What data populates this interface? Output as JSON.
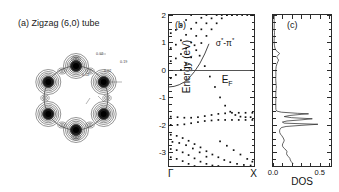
{
  "figure": {
    "panels": [
      "a",
      "b",
      "c"
    ]
  },
  "panel_a": {
    "label": "(a) Zigzag (6,0) tube",
    "type": "contour",
    "description": "charge density contour cross-section of zigzag (6,0) nanotube with 6 carbon atom lobes around a ring",
    "atom_count": 6,
    "contour_labels": [
      {
        "text": "0.02",
        "x": 96,
        "y": 53
      },
      {
        "text": "0.19",
        "x": 118,
        "y": 61
      },
      {
        "text": "0.02",
        "x": 102,
        "y": 70
      },
      {
        "text": "0.02",
        "x": 84,
        "y": 73
      }
    ]
  },
  "chart_data": [
    {
      "panel": "b",
      "type": "scatter",
      "label": "(b)",
      "ylabel": "Energy (eV)",
      "ylim": [
        -3.5,
        2.0
      ],
      "yticks": [
        2,
        1,
        0,
        -1,
        -2,
        -3
      ],
      "xlim": [
        0,
        1
      ],
      "xticklabels": [
        "Γ",
        "X"
      ],
      "grid": false,
      "annotations": [
        {
          "text": "E_F",
          "display": "E",
          "sub": "F",
          "y": 0.0
        },
        {
          "text": "σ*-π*",
          "y": 0.95,
          "x": 0.62
        }
      ],
      "fermi_level": 0.0,
      "series": [
        {
          "name": "sigma-pi-hybrid-band",
          "style": "solid",
          "x": [
            0.0,
            0.06,
            0.12,
            0.18,
            0.24,
            0.3,
            0.36,
            0.42,
            0.47
          ],
          "y": [
            -0.62,
            -0.6,
            -0.54,
            -0.44,
            -0.28,
            -0.06,
            0.22,
            0.58,
            0.95
          ]
        },
        {
          "name": "band-dots-1",
          "style": "dotted",
          "x": [
            0.02,
            0.08,
            0.14,
            0.2,
            0.26,
            0.32,
            0.38,
            0.44,
            0.5,
            0.56,
            0.62,
            0.68,
            0.74,
            0.8,
            0.86,
            0.92,
            0.98
          ],
          "y": [
            -0.3,
            -0.18,
            0.0,
            0.22,
            0.46,
            0.72,
            0.98,
            1.24,
            1.48,
            1.7,
            1.88,
            2.0,
            2.0,
            2.0,
            2.0,
            2.0,
            2.0
          ]
        },
        {
          "name": "band-dots-2",
          "style": "dotted",
          "x": [
            0.02,
            0.08,
            0.14,
            0.2,
            0.26,
            0.32,
            0.38,
            0.44,
            0.5,
            0.56,
            0.62,
            0.68,
            0.74
          ],
          "y": [
            0.32,
            0.42,
            0.58,
            0.78,
            1.0,
            1.24,
            1.48,
            1.7,
            1.88,
            2.0,
            2.0,
            2.0,
            2.0
          ]
        },
        {
          "name": "band-dots-3",
          "style": "dotted",
          "x": [
            0.02,
            0.08,
            0.14,
            0.2,
            0.26,
            0.32,
            0.38,
            0.44
          ],
          "y": [
            0.8,
            0.92,
            1.08,
            1.28,
            1.5,
            1.72,
            1.9,
            2.0
          ]
        },
        {
          "name": "band-dots-4",
          "style": "dotted",
          "x": [
            0.02,
            0.08,
            0.14,
            0.2,
            0.26
          ],
          "y": [
            1.34,
            1.46,
            1.62,
            1.82,
            2.0
          ]
        },
        {
          "name": "valence-dots-1",
          "style": "dotted",
          "x": [
            0.3,
            0.36,
            0.42,
            0.48,
            0.54,
            0.6,
            0.66,
            0.72,
            0.78,
            0.84,
            0.9,
            0.96
          ],
          "y": [
            0.9,
            0.52,
            0.14,
            -0.24,
            -0.62,
            -1.0,
            -1.3,
            -1.52,
            -1.64,
            -1.7,
            -1.72,
            -1.72
          ]
        },
        {
          "name": "flat-band-near-1.7",
          "style": "dotted",
          "x": [
            0.02,
            0.1,
            0.18,
            0.26,
            0.34,
            0.42,
            0.5,
            0.58,
            0.66,
            0.74,
            0.82,
            0.9,
            0.98
          ],
          "y": [
            -1.7,
            -1.72,
            -1.74,
            -1.74,
            -1.72,
            -1.68,
            -1.64,
            -1.6,
            -1.58,
            -1.56,
            -1.56,
            -1.56,
            -1.56
          ]
        },
        {
          "name": "flat-band-near-2.0",
          "style": "dotted",
          "x": [
            0.02,
            0.1,
            0.18,
            0.26,
            0.34,
            0.42,
            0.5,
            0.58,
            0.66,
            0.74,
            0.82,
            0.9,
            0.98
          ],
          "y": [
            -2.0,
            -2.0,
            -1.98,
            -1.94,
            -1.9,
            -1.86,
            -1.84,
            -1.82,
            -1.82,
            -1.82,
            -1.82,
            -1.82,
            -1.82
          ]
        },
        {
          "name": "lower-band-1",
          "style": "dotted",
          "x": [
            0.02,
            0.09,
            0.16,
            0.23,
            0.3,
            0.37,
            0.44,
            0.51,
            0.58,
            0.65,
            0.72,
            0.8,
            0.88,
            0.96
          ],
          "y": [
            -2.36,
            -2.4,
            -2.48,
            -2.58,
            -2.7,
            -2.82,
            -2.96,
            -3.08,
            -3.18,
            -3.28,
            -3.36,
            -3.42,
            -3.46,
            -3.48
          ]
        },
        {
          "name": "lower-band-2",
          "style": "dotted",
          "x": [
            0.02,
            0.09,
            0.16,
            0.23,
            0.3,
            0.37,
            0.44,
            0.51,
            0.58
          ],
          "y": [
            -2.88,
            -2.92,
            -3.0,
            -3.1,
            -3.22,
            -3.34,
            -3.42,
            -3.48,
            -3.5
          ]
        },
        {
          "name": "lower-band-3",
          "style": "dotted",
          "x": [
            0.02,
            0.09,
            0.16,
            0.23,
            0.3
          ],
          "y": [
            -3.18,
            -3.24,
            -3.32,
            -3.42,
            -3.5
          ]
        },
        {
          "name": "lower-band-4",
          "style": "dotted",
          "x": [
            0.6,
            0.68,
            0.76,
            0.84,
            0.92,
            0.98
          ],
          "y": [
            -2.6,
            -2.76,
            -2.92,
            -3.08,
            -3.24,
            -3.34
          ]
        },
        {
          "name": "lower-band-5",
          "style": "dotted",
          "x": [
            0.04,
            0.12,
            0.2,
            0.28,
            0.36,
            0.44
          ],
          "y": [
            -2.62,
            -2.66,
            -2.74,
            -2.86,
            -3.0,
            -3.16
          ]
        }
      ]
    },
    {
      "panel": "c",
      "type": "line",
      "label": "(c)",
      "xlabel": "DOS",
      "xlim": [
        0.0,
        0.62
      ],
      "xticks": [
        0.0,
        0.5
      ],
      "xticklabels": [
        "0.0",
        "0.5"
      ],
      "ylim": [
        -3.5,
        2.0
      ],
      "grid": false,
      "orientation": "vertical",
      "series": [
        {
          "name": "dos-curve",
          "energy": [
            2.0,
            1.9,
            1.8,
            1.7,
            1.6,
            1.5,
            1.42,
            1.36,
            1.3,
            1.22,
            1.14,
            1.06,
            1.0,
            0.94,
            0.88,
            0.8,
            0.72,
            0.66,
            0.6,
            0.54,
            0.48,
            0.42,
            0.36,
            0.3,
            0.24,
            0.18,
            0.12,
            0.06,
            0.0,
            -0.08,
            -0.16,
            -0.24,
            -0.32,
            -0.4,
            -0.48,
            -0.56,
            -0.62,
            -0.68,
            -0.74,
            -0.8,
            -0.88,
            -0.96,
            -1.04,
            -1.12,
            -1.2,
            -1.28,
            -1.36,
            -1.44,
            -1.5,
            -1.54,
            -1.58,
            -1.6,
            -1.62,
            -1.66,
            -1.7,
            -1.74,
            -1.78,
            -1.82,
            -1.86,
            -1.9,
            -1.94,
            -1.98,
            -2.02,
            -2.06,
            -2.1,
            -2.16,
            -2.22,
            -2.28,
            -2.34,
            -2.4,
            -2.48,
            -2.56,
            -2.62,
            -2.68,
            -2.74,
            -2.8,
            -2.86,
            -2.92,
            -2.98,
            -3.04,
            -3.1,
            -3.16,
            -3.22,
            -3.28,
            -3.34,
            -3.4,
            -3.46,
            -3.5
          ],
          "dos": [
            0.012,
            0.013,
            0.012,
            0.014,
            0.013,
            0.012,
            0.014,
            0.016,
            0.015,
            0.014,
            0.013,
            0.012,
            0.013,
            0.014,
            0.016,
            0.02,
            0.03,
            0.05,
            0.07,
            0.055,
            0.04,
            0.048,
            0.06,
            0.052,
            0.044,
            0.038,
            0.034,
            0.032,
            0.03,
            0.03,
            0.031,
            0.03,
            0.029,
            0.03,
            0.032,
            0.034,
            0.036,
            0.034,
            0.032,
            0.031,
            0.03,
            0.029,
            0.03,
            0.03,
            0.029,
            0.03,
            0.03,
            0.031,
            0.04,
            0.09,
            0.26,
            0.38,
            0.3,
            0.18,
            0.12,
            0.2,
            0.42,
            0.3,
            0.15,
            0.1,
            0.12,
            0.48,
            0.3,
            0.14,
            0.09,
            0.075,
            0.07,
            0.072,
            0.08,
            0.095,
            0.11,
            0.12,
            0.115,
            0.105,
            0.1,
            0.105,
            0.12,
            0.14,
            0.15,
            0.145,
            0.15,
            0.165,
            0.18,
            0.185,
            0.195,
            0.21,
            0.225,
            0.23,
            0.235
          ]
        }
      ]
    }
  ]
}
